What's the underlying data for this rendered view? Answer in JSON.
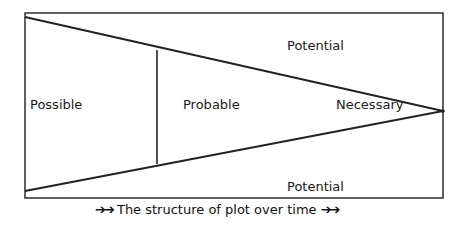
{
  "diagram": {
    "title": "The structure of plot over time",
    "caption": {
      "prefix_arrows": "➔➔",
      "text": "The structure of plot over time",
      "suffix_arrows": "➔➔"
    },
    "regions": {
      "possible": "Possible",
      "probable": "Probable",
      "necessary": "Necessary",
      "potential_top": "Potential",
      "potential_bottom": "Potential"
    },
    "colors": {
      "line": "#222222",
      "border": "#333333",
      "background": "#ffffff"
    }
  }
}
